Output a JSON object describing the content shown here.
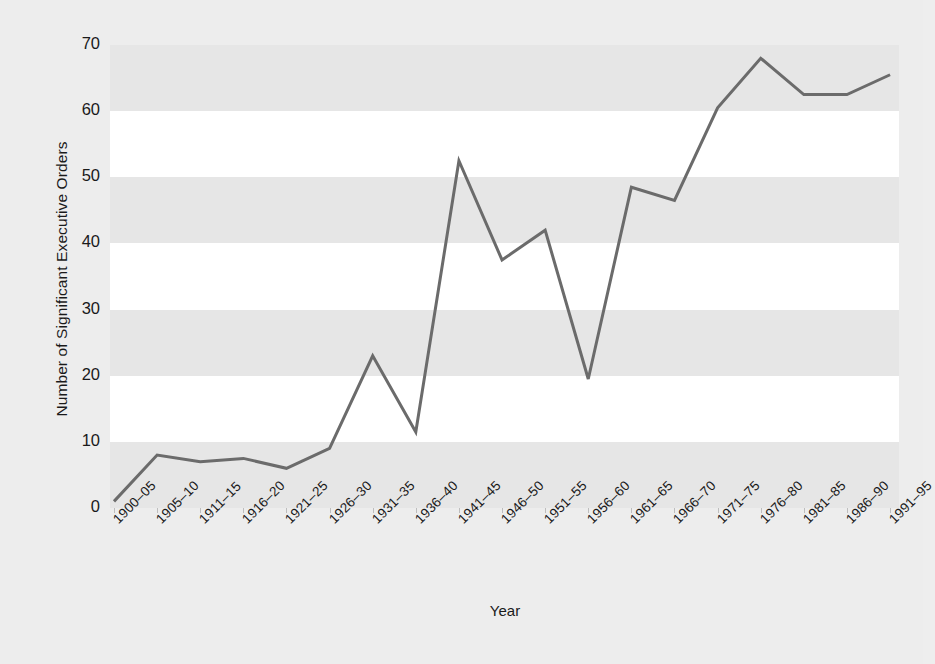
{
  "chart_data": {
    "type": "line",
    "title": "",
    "xlabel": "Year",
    "ylabel": "Number of Significant Executive Orders",
    "categories": [
      "1900–05",
      "1905–10",
      "1911–15",
      "1916–20",
      "1921–25",
      "1926–30",
      "1931–35",
      "1936–40",
      "1941–45",
      "1946–50",
      "1951–55",
      "1956–60",
      "1961–65",
      "1966–70",
      "1971–75",
      "1976–80",
      "1981–85",
      "1986–90",
      "1991–95"
    ],
    "values": [
      1,
      8,
      7,
      7.5,
      6,
      9,
      23,
      11.5,
      52.5,
      37.5,
      42,
      19.5,
      48.5,
      46.5,
      60.5,
      68,
      62.5,
      62.5,
      65.5
    ],
    "ylim": [
      0,
      70
    ],
    "yticks": [
      0,
      10,
      20,
      30,
      40,
      50,
      60,
      70
    ],
    "ytick_labels": [
      "0",
      "10",
      "20",
      "30",
      "40",
      "50",
      "60",
      "70"
    ],
    "grid": false,
    "banded_background": true,
    "band_color": "#e6e6e6",
    "plot_background": "#ffffff",
    "line_color": "#6b6b6b",
    "line_width": 3,
    "markers": false,
    "legend": null,
    "figure_background": "#ededed"
  },
  "axis": {
    "y_title": "Number of Significant Executive Orders",
    "x_title": "Year"
  }
}
